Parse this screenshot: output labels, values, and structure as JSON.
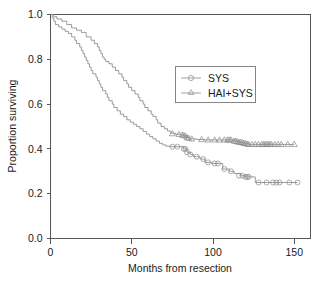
{
  "chart_data": {
    "type": "line",
    "subtype": "kaplan-meier-step",
    "title": "",
    "xlabel": "Months from resection",
    "ylabel": "Proportion surviving",
    "xlim": [
      0,
      160
    ],
    "ylim": [
      0.0,
      1.0
    ],
    "xticks": [
      0,
      50,
      100,
      150
    ],
    "xtick_labels": [
      "0",
      "50",
      "100",
      "150"
    ],
    "yticks": [
      0.0,
      0.2,
      0.4,
      0.6,
      0.8,
      1.0
    ],
    "ytick_labels": [
      "0.0",
      "0.2",
      "0.4",
      "0.6",
      "0.8",
      "1.0"
    ],
    "grid": false,
    "legend_position": "upper-right-inset",
    "line_color": "#8a8a8a",
    "axis_color": "#555555",
    "series": [
      {
        "name": "SYS",
        "marker": "circle",
        "marker_label": "open-circle",
        "points": [
          [
            0,
            1.0
          ],
          [
            1,
            0.985
          ],
          [
            2,
            0.97
          ],
          [
            3,
            0.955
          ],
          [
            5,
            0.945
          ],
          [
            7,
            0.935
          ],
          [
            9,
            0.925
          ],
          [
            11,
            0.915
          ],
          [
            13,
            0.9
          ],
          [
            15,
            0.885
          ],
          [
            16,
            0.87
          ],
          [
            18,
            0.855
          ],
          [
            19,
            0.84
          ],
          [
            20,
            0.825
          ],
          [
            21,
            0.81
          ],
          [
            22,
            0.795
          ],
          [
            23,
            0.78
          ],
          [
            24,
            0.765
          ],
          [
            25,
            0.75
          ],
          [
            26,
            0.735
          ],
          [
            28,
            0.72
          ],
          [
            29,
            0.705
          ],
          [
            30,
            0.69
          ],
          [
            31,
            0.675
          ],
          [
            32,
            0.66
          ],
          [
            34,
            0.645
          ],
          [
            35,
            0.63
          ],
          [
            36,
            0.615
          ],
          [
            38,
            0.6
          ],
          [
            39,
            0.585
          ],
          [
            41,
            0.57
          ],
          [
            43,
            0.555
          ],
          [
            45,
            0.545
          ],
          [
            47,
            0.53
          ],
          [
            49,
            0.52
          ],
          [
            51,
            0.51
          ],
          [
            53,
            0.5
          ],
          [
            55,
            0.49
          ],
          [
            57,
            0.478
          ],
          [
            59,
            0.466
          ],
          [
            61,
            0.455
          ],
          [
            63,
            0.445
          ],
          [
            65,
            0.435
          ],
          [
            67,
            0.425
          ],
          [
            69,
            0.418
          ],
          [
            71,
            0.412
          ],
          [
            74,
            0.41
          ],
          [
            79,
            0.41
          ],
          [
            82,
            0.4
          ],
          [
            84,
            0.385
          ],
          [
            86,
            0.375
          ],
          [
            88,
            0.365
          ],
          [
            92,
            0.355
          ],
          [
            95,
            0.34
          ],
          [
            99,
            0.335
          ],
          [
            103,
            0.335
          ],
          [
            106,
            0.31
          ],
          [
            110,
            0.3
          ],
          [
            113,
            0.29
          ],
          [
            117,
            0.28
          ],
          [
            120,
            0.275
          ],
          [
            123,
            0.275
          ],
          [
            126,
            0.25
          ],
          [
            130,
            0.25
          ],
          [
            135,
            0.25
          ],
          [
            140,
            0.25
          ],
          [
            145,
            0.25
          ],
          [
            152,
            0.25
          ]
        ],
        "censored": [
          [
            75,
            0.41
          ],
          [
            78,
            0.41
          ],
          [
            82,
            0.4
          ],
          [
            83,
            0.4
          ],
          [
            84,
            0.385
          ],
          [
            86,
            0.375
          ],
          [
            90,
            0.365
          ],
          [
            94,
            0.355
          ],
          [
            97,
            0.34
          ],
          [
            101,
            0.335
          ],
          [
            103,
            0.335
          ],
          [
            107,
            0.31
          ],
          [
            111,
            0.3
          ],
          [
            116,
            0.28
          ],
          [
            118,
            0.28
          ],
          [
            120,
            0.275
          ],
          [
            121,
            0.275
          ],
          [
            122,
            0.275
          ],
          [
            128,
            0.25
          ],
          [
            133,
            0.25
          ],
          [
            137,
            0.25
          ],
          [
            139,
            0.25
          ],
          [
            141,
            0.25
          ],
          [
            147,
            0.25
          ],
          [
            152,
            0.25
          ]
        ]
      },
      {
        "name": "HAI+SYS",
        "marker": "triangle",
        "marker_label": "open-triangle",
        "points": [
          [
            0,
            1.0
          ],
          [
            2,
            0.99
          ],
          [
            4,
            0.98
          ],
          [
            7,
            0.97
          ],
          [
            10,
            0.955
          ],
          [
            13,
            0.94
          ],
          [
            16,
            0.93
          ],
          [
            19,
            0.92
          ],
          [
            22,
            0.9
          ],
          [
            25,
            0.885
          ],
          [
            27,
            0.87
          ],
          [
            29,
            0.855
          ],
          [
            30,
            0.84
          ],
          [
            31,
            0.825
          ],
          [
            32,
            0.81
          ],
          [
            33,
            0.8
          ],
          [
            34,
            0.79
          ],
          [
            36,
            0.78
          ],
          [
            38,
            0.765
          ],
          [
            40,
            0.75
          ],
          [
            42,
            0.735
          ],
          [
            44,
            0.72
          ],
          [
            45,
            0.705
          ],
          [
            47,
            0.69
          ],
          [
            48,
            0.675
          ],
          [
            50,
            0.66
          ],
          [
            52,
            0.645
          ],
          [
            54,
            0.63
          ],
          [
            55,
            0.615
          ],
          [
            57,
            0.6
          ],
          [
            58,
            0.585
          ],
          [
            60,
            0.57
          ],
          [
            62,
            0.555
          ],
          [
            63,
            0.545
          ],
          [
            65,
            0.53
          ],
          [
            66,
            0.515
          ],
          [
            68,
            0.5
          ],
          [
            70,
            0.49
          ],
          [
            72,
            0.48
          ],
          [
            74,
            0.47
          ],
          [
            77,
            0.465
          ],
          [
            80,
            0.462
          ],
          [
            82,
            0.458
          ],
          [
            84,
            0.45
          ],
          [
            86,
            0.445
          ],
          [
            90,
            0.442
          ],
          [
            95,
            0.44
          ],
          [
            100,
            0.44
          ],
          [
            105,
            0.44
          ],
          [
            110,
            0.44
          ],
          [
            113,
            0.435
          ],
          [
            116,
            0.43
          ],
          [
            119,
            0.425
          ],
          [
            122,
            0.42
          ],
          [
            126,
            0.42
          ],
          [
            132,
            0.42
          ],
          [
            138,
            0.42
          ],
          [
            144,
            0.42
          ],
          [
            150,
            0.42
          ]
        ],
        "censored": [
          [
            75,
            0.468
          ],
          [
            79,
            0.465
          ],
          [
            81,
            0.462
          ],
          [
            82,
            0.46
          ],
          [
            83,
            0.458
          ],
          [
            84,
            0.45
          ],
          [
            85,
            0.448
          ],
          [
            87,
            0.445
          ],
          [
            93,
            0.442
          ],
          [
            97,
            0.44
          ],
          [
            101,
            0.44
          ],
          [
            104,
            0.44
          ],
          [
            107,
            0.44
          ],
          [
            109,
            0.44
          ],
          [
            110,
            0.44
          ],
          [
            111,
            0.44
          ],
          [
            113,
            0.435
          ],
          [
            114,
            0.434
          ],
          [
            115,
            0.432
          ],
          [
            116,
            0.43
          ],
          [
            117,
            0.429
          ],
          [
            118,
            0.428
          ],
          [
            119,
            0.425
          ],
          [
            120,
            0.424
          ],
          [
            121,
            0.422
          ],
          [
            122,
            0.42
          ],
          [
            124,
            0.42
          ],
          [
            126,
            0.42
          ],
          [
            128,
            0.42
          ],
          [
            130,
            0.42
          ],
          [
            131,
            0.42
          ],
          [
            132,
            0.42
          ],
          [
            133,
            0.42
          ],
          [
            134,
            0.42
          ],
          [
            135,
            0.42
          ],
          [
            136,
            0.42
          ],
          [
            138,
            0.42
          ],
          [
            140,
            0.42
          ],
          [
            142,
            0.42
          ],
          [
            146,
            0.42
          ],
          [
            150,
            0.42
          ]
        ]
      }
    ],
    "legend": [
      {
        "label": "SYS",
        "marker": "circle"
      },
      {
        "label": "HAI+SYS",
        "marker": "triangle"
      }
    ]
  }
}
